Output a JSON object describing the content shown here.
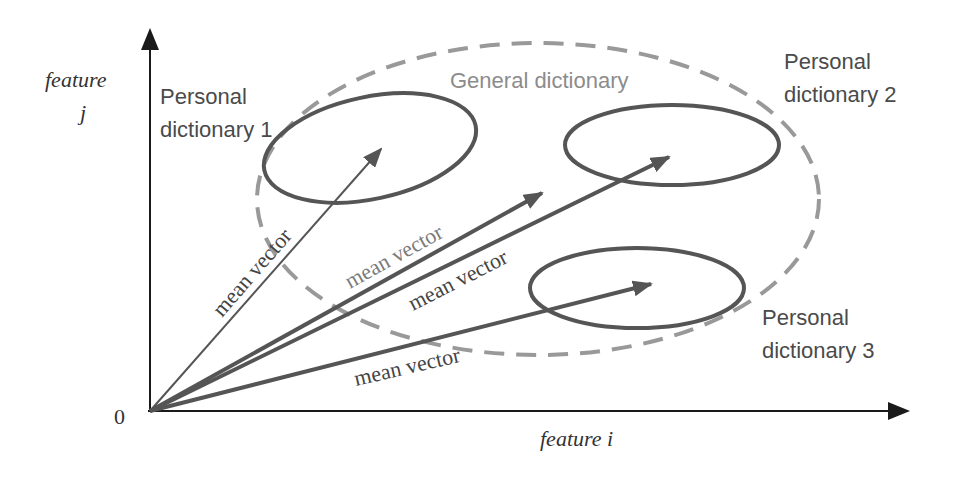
{
  "axes": {
    "y_label_line1": "feature",
    "y_label_line2": "j",
    "x_label": "feature i",
    "origin_label": "0"
  },
  "general_dictionary": {
    "label": "General dictionary",
    "style": "dashed"
  },
  "personal_dictionaries": [
    {
      "label_line1": "Personal",
      "label_line2": "dictionary 1"
    },
    {
      "label_line1": "Personal",
      "label_line2": "dictionary 2"
    },
    {
      "label_line1": "Personal",
      "label_line2": "dictionary 3"
    }
  ],
  "vectors": [
    {
      "label": "mean vector",
      "target": "personal dictionary 1"
    },
    {
      "label": "mean vector",
      "target": "general dictionary"
    },
    {
      "label": "mean vector",
      "target": "personal dictionary 2"
    },
    {
      "label": "mean vector",
      "target": "personal dictionary 3"
    }
  ],
  "colors": {
    "axis": "#1a1a1a",
    "ellipse": "#555555",
    "dashed": "#999999",
    "general_label": "#8c8c8c",
    "text": "#4a4a4a",
    "vector": "#555555"
  }
}
